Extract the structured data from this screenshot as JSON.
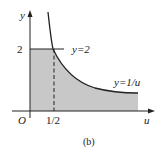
{
  "figure": {
    "caption": "(b)",
    "axes": {
      "x_label": "u",
      "y_label": "y",
      "origin_label": "O",
      "x_tick_label": "1/2",
      "y_tick_label": "2"
    },
    "curves": {
      "horizontal_line_label": "y=2",
      "hyperbola_label": "y=1/u"
    },
    "colors": {
      "shade": "#c8c8c8",
      "line": "#222222"
    }
  }
}
